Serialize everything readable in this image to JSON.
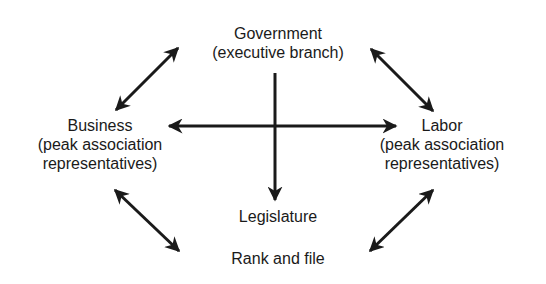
{
  "diagram": {
    "type": "relationship-diagram",
    "colors": {
      "ink": "#1a1a1a",
      "background": "#ffffff"
    },
    "nodes": {
      "government": {
        "title": "Government",
        "subtitle": "(executive branch)"
      },
      "business": {
        "title": "Business",
        "subtitle_line1": "(peak association",
        "subtitle_line2": "representatives)"
      },
      "labor": {
        "title": "Labor",
        "subtitle_line1": "(peak association",
        "subtitle_line2": "representatives)"
      },
      "legislature": {
        "title": "Legislature"
      },
      "rank_and_file": {
        "title": "Rank and file"
      }
    },
    "edges": [
      {
        "from": "government",
        "to": "business",
        "direction": "both"
      },
      {
        "from": "government",
        "to": "labor",
        "direction": "both"
      },
      {
        "from": "business",
        "to": "labor",
        "direction": "both"
      },
      {
        "from": "government",
        "to": "legislature",
        "direction": "one-way"
      },
      {
        "from": "business",
        "to": "rank_and_file",
        "direction": "both"
      },
      {
        "from": "labor",
        "to": "rank_and_file",
        "direction": "both"
      }
    ]
  }
}
